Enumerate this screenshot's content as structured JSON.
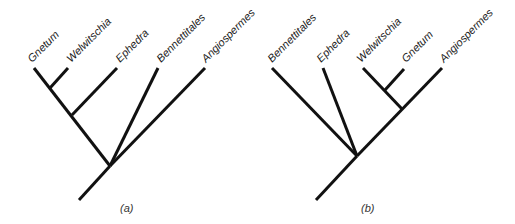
{
  "colors": {
    "background": "#ffffff",
    "branch": "#111111",
    "text": "#222222"
  },
  "panels": [
    {
      "id": "a",
      "caption": "(a)",
      "topology": "((((Gnetum,Welwitschia),Ephedra),Bennettitales),Angiospermes)",
      "taxa": [
        "Gnetum",
        "Welwitschia",
        "Ephedra",
        "Bennettitales",
        "Angiospermes"
      ]
    },
    {
      "id": "b",
      "caption": "(b)",
      "topology": "(Bennettitales,Ephedra,((Welwitschia,Gnetum),Angiospermes))",
      "taxa": [
        "Bennettitales",
        "Ephedra",
        "Welwitschia",
        "Gnetum",
        "Angiospermes"
      ]
    }
  ]
}
